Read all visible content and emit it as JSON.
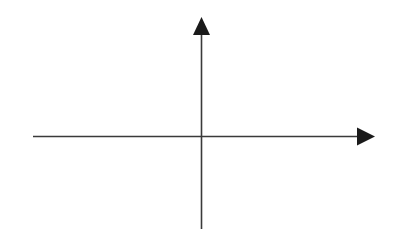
{
  "diagram": {
    "type": "coordinate-axes",
    "colors": {
      "background": "#ffffff",
      "line": "#3a3a3a",
      "arrowhead": "#1a1a1a"
    },
    "x_axis": {
      "direction": "right",
      "has_arrow": true,
      "label": ""
    },
    "y_axis": {
      "direction": "up",
      "has_arrow": true,
      "label": ""
    },
    "origin_label": ""
  }
}
